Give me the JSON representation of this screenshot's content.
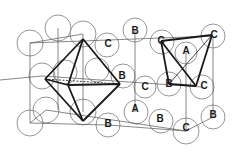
{
  "diagram": {
    "type": "crystal-lattice",
    "colors": {
      "atom_outline": "#8a8a8a",
      "lattice_line": "#555555",
      "polyhedron": "#1a1a1a",
      "label": "#1a1a1a"
    },
    "atoms": [
      {
        "x": 30,
        "y": 43,
        "r": 13,
        "label": ""
      },
      {
        "x": 58,
        "y": 28,
        "r": 13,
        "label": ""
      },
      {
        "x": 83,
        "y": 34,
        "r": 13,
        "label": ""
      },
      {
        "x": 107,
        "y": 45,
        "r": 12,
        "label": "C"
      },
      {
        "x": 135,
        "y": 30,
        "r": 12,
        "label": "B"
      },
      {
        "x": 162,
        "y": 42,
        "r": 12,
        "label": "C"
      },
      {
        "x": 186,
        "y": 53,
        "r": 11,
        "label": "A"
      },
      {
        "x": 213,
        "y": 36,
        "r": 12,
        "label": "C"
      },
      {
        "x": 42,
        "y": 76,
        "r": 13,
        "label": ""
      },
      {
        "x": 65,
        "y": 72,
        "r": 12,
        "label": ""
      },
      {
        "x": 97,
        "y": 70,
        "r": 12,
        "label": ""
      },
      {
        "x": 123,
        "y": 76,
        "r": 12,
        "label": "B"
      },
      {
        "x": 145,
        "y": 87,
        "r": 11,
        "label": "C"
      },
      {
        "x": 169,
        "y": 84,
        "r": 12,
        "label": "B"
      },
      {
        "x": 202,
        "y": 87,
        "r": 12,
        "label": "C"
      },
      {
        "x": 46,
        "y": 110,
        "r": 13,
        "label": ""
      },
      {
        "x": 83,
        "y": 112,
        "r": 13,
        "label": ""
      },
      {
        "x": 30,
        "y": 123,
        "r": 13,
        "label": ""
      },
      {
        "x": 108,
        "y": 125,
        "r": 12,
        "label": "B"
      },
      {
        "x": 136,
        "y": 112,
        "r": 12,
        "label": "A"
      },
      {
        "x": 161,
        "y": 121,
        "r": 12,
        "label": "B"
      },
      {
        "x": 186,
        "y": 131,
        "r": 13,
        "label": "C"
      },
      {
        "x": 213,
        "y": 117,
        "r": 12,
        "label": "B"
      }
    ],
    "labels": [
      {
        "text": "C",
        "x": 108,
        "y": 44
      },
      {
        "text": "B",
        "x": 135,
        "y": 31
      },
      {
        "text": "C",
        "x": 161,
        "y": 41
      },
      {
        "text": "A",
        "x": 186,
        "y": 51
      },
      {
        "text": "C",
        "x": 214,
        "y": 35
      },
      {
        "text": "B",
        "x": 122,
        "y": 76
      },
      {
        "text": "C",
        "x": 145,
        "y": 87
      },
      {
        "text": "B",
        "x": 169,
        "y": 84
      },
      {
        "text": "C",
        "x": 204,
        "y": 86
      },
      {
        "text": "A",
        "x": 135,
        "y": 109
      },
      {
        "text": "B",
        "x": 160,
        "y": 119
      },
      {
        "text": "C",
        "x": 186,
        "y": 128
      },
      {
        "text": "B",
        "x": 213,
        "y": 115
      },
      {
        "text": "B",
        "x": 108,
        "y": 124
      }
    ]
  }
}
